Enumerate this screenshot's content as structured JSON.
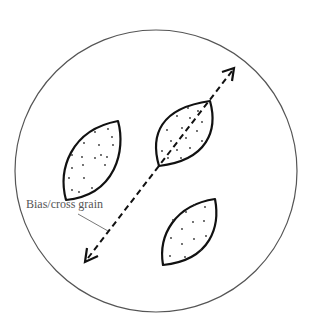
{
  "diagram": {
    "type": "pattern layout on circular fabric",
    "label": "Bias/cross grain",
    "colors": {
      "outline": "#111111",
      "circle": "#555555",
      "label": "#555555",
      "background": "#ffffff"
    },
    "elements": [
      {
        "name": "fabric-circle",
        "shape": "circle"
      },
      {
        "name": "pattern-piece-left",
        "shape": "leaf",
        "fill": "dotted"
      },
      {
        "name": "pattern-piece-top-right",
        "shape": "leaf",
        "fill": "dotted"
      },
      {
        "name": "pattern-piece-bottom-right",
        "shape": "leaf",
        "fill": "dotted"
      },
      {
        "name": "bias-grain-arrow",
        "shape": "dashed double-headed arrow"
      }
    ]
  }
}
